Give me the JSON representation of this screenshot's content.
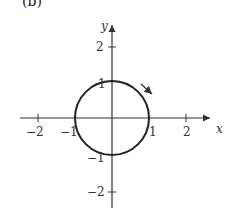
{
  "figure": {
    "part_label": "(b)",
    "x_axis_label": "x",
    "y_axis_label": "y",
    "x_ticks": [
      {
        "value": -2,
        "label": "−2"
      },
      {
        "value": -1,
        "label": "−1"
      },
      {
        "value": 1,
        "label": "1"
      },
      {
        "value": 2,
        "label": "2"
      }
    ],
    "y_ticks": [
      {
        "value": 2,
        "label": "2"
      },
      {
        "value": 1,
        "label": "1"
      },
      {
        "value": -1,
        "label": "−1"
      },
      {
        "value": -2,
        "label": "−2"
      }
    ],
    "curve": {
      "type": "unit-circle",
      "radius": 1,
      "center": [
        0,
        0
      ],
      "direction": "clockwise"
    },
    "colors": {
      "stroke": "#222222",
      "axis": "#333333"
    }
  }
}
